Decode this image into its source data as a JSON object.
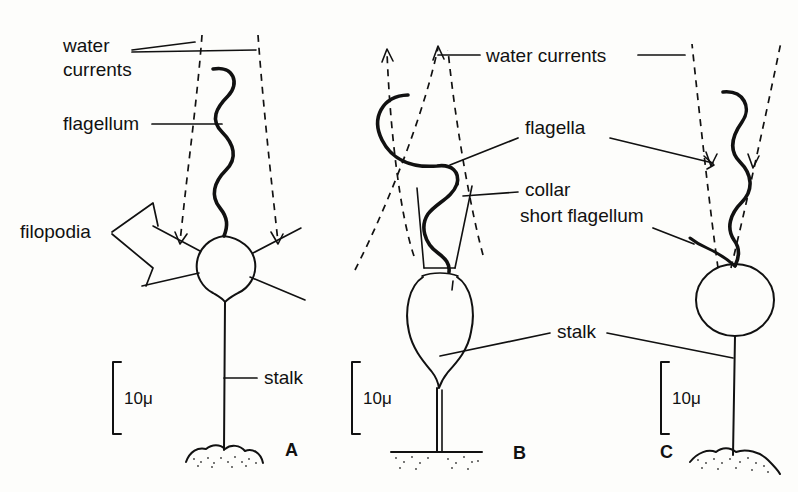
{
  "figure": {
    "header_ghost": "",
    "background_color": "#fdfdfb",
    "ink_color": "#111111",
    "caption_note": "Three choanoflagellate / protozoan cell types drawn with water current arrows"
  },
  "panels": [
    {
      "id": "A",
      "panel_label": "A",
      "scale_label": "10μ",
      "labels": {
        "water_currents_line1": "water",
        "water_currents_line2": "currents",
        "flagellum": "flagellum",
        "filopodia": "filopodia",
        "stalk": "stalk"
      }
    },
    {
      "id": "B",
      "panel_label": "B",
      "scale_label": "10μ",
      "labels": {
        "water_currents": "water currents",
        "flagella": "flagella",
        "collar": "collar",
        "stalk": "stalk"
      }
    },
    {
      "id": "C",
      "panel_label": "C",
      "scale_label": "10μ",
      "labels": {
        "short_flagellum": "short flagellum",
        "stalk": "stalk"
      }
    }
  ],
  "labels_flat": {
    "a_water_1": "water",
    "a_water_2": "currents",
    "a_flagellum": "flagellum",
    "a_filopodia": "filopodia",
    "a_stalk": "stalk",
    "a_scale": "10μ",
    "a_panel": "A",
    "bc_water_currents": "water currents",
    "b_flagella": "flagella",
    "b_collar": "collar",
    "c_short_flagellum": "short flagellum",
    "bc_stalk": "stalk",
    "b_scale": "10μ",
    "b_panel": "B",
    "c_scale": "10μ",
    "c_panel": "C"
  }
}
